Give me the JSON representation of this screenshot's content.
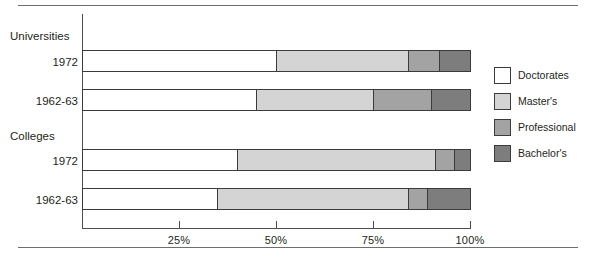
{
  "chart_data": {
    "type": "bar",
    "orientation": "horizontal",
    "stacked": true,
    "title": "",
    "xlabel": "",
    "ylabel": "",
    "xlim": [
      0,
      100
    ],
    "grid": false,
    "legend_position": "right",
    "xticks": [
      "25%",
      "50%",
      "75%",
      "100%"
    ],
    "xtick_values": [
      25,
      50,
      75,
      100
    ],
    "groups": [
      {
        "label": "Universities",
        "rows": [
          {
            "label": "1972",
            "values": [
              50,
              34,
              8,
              8
            ]
          },
          {
            "label": "1962-63",
            "values": [
              45,
              30,
              15,
              10
            ]
          }
        ]
      },
      {
        "label": "Colleges",
        "rows": [
          {
            "label": "1972",
            "values": [
              40,
              51,
              5,
              4
            ]
          },
          {
            "label": "1962-63",
            "values": [
              35,
              49,
              5,
              11
            ]
          }
        ]
      }
    ],
    "series": [
      {
        "name": "Doctorates",
        "color": "#ffffff",
        "values": [
          50,
          45,
          40,
          35
        ]
      },
      {
        "name": "Master's",
        "color": "#d4d4d4",
        "values": [
          34,
          30,
          51,
          49
        ]
      },
      {
        "name": "Professional",
        "color": "#a3a3a3",
        "values": [
          8,
          15,
          5,
          5
        ]
      },
      {
        "name": "Bachelor's",
        "color": "#7d7d7d",
        "values": [
          8,
          10,
          4,
          11
        ]
      }
    ]
  },
  "legend": {
    "items": [
      {
        "label": "Doctorates",
        "color": "#ffffff"
      },
      {
        "label": "Master's",
        "color": "#d4d4d4"
      },
      {
        "label": "Professional",
        "color": "#a3a3a3"
      },
      {
        "label": "Bachelor's",
        "color": "#7d7d7d"
      }
    ]
  },
  "axis_labels": {
    "t25": "25%",
    "t50": "50%",
    "t75": "75%",
    "t100": "100%"
  },
  "row_labels": {
    "group_universities": "Universities",
    "group_colleges": "Colleges",
    "uni_1972": "1972",
    "uni_1962": "1962-63",
    "col_1972": "1972",
    "col_1962": "1962-63"
  }
}
